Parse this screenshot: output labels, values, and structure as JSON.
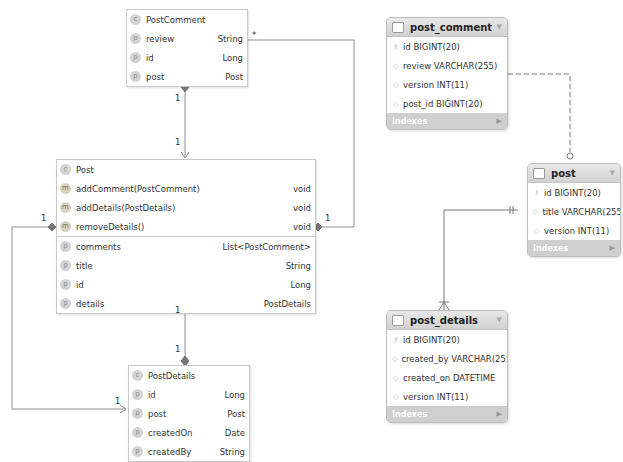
{
  "uml": {
    "post_comment": {
      "name": "PostComment",
      "class_icon": "c",
      "rows": [
        {
          "icon": "p",
          "name": "review",
          "type": "String"
        },
        {
          "icon": "p",
          "name": "id",
          "type": "Long"
        },
        {
          "icon": "p",
          "name": "post",
          "type": "Post"
        }
      ]
    },
    "post": {
      "name": "Post",
      "class_icon": "c",
      "methods": [
        {
          "icon": "m",
          "name": "addComment(PostComment)",
          "type": "void"
        },
        {
          "icon": "m",
          "name": "addDetails(PostDetails)",
          "type": "void"
        },
        {
          "icon": "m",
          "name": "removeDetails()",
          "type": "void"
        }
      ],
      "fields": [
        {
          "icon": "p",
          "name": "comments",
          "type": "List<PostComment>"
        },
        {
          "icon": "p",
          "name": "title",
          "type": "String"
        },
        {
          "icon": "p",
          "name": "id",
          "type": "Long"
        },
        {
          "icon": "p",
          "name": "details",
          "type": "PostDetails"
        }
      ]
    },
    "post_details": {
      "name": "PostDetails",
      "class_icon": "c",
      "rows": [
        {
          "icon": "p",
          "name": "id",
          "type": "Long"
        },
        {
          "icon": "p",
          "name": "post",
          "type": "Post"
        },
        {
          "icon": "p",
          "name": "createdOn",
          "type": "Date"
        },
        {
          "icon": "p",
          "name": "createdBy",
          "type": "String"
        }
      ]
    },
    "multiplicities": {
      "comment_many": "*",
      "comment_post_top": "1",
      "comment_post_bottom": "1",
      "post_comments_right": "1",
      "details_left_top": "1",
      "details_left_bottom": "1",
      "post_details_top": "1",
      "post_details_bottom": "1"
    }
  },
  "er": {
    "indexes_label": "Indexes",
    "post_comment": {
      "name": "post_comment",
      "columns": [
        "id BIGINT(20)",
        "review VARCHAR(255)",
        "version INT(11)",
        "post_id BIGINT(20)"
      ]
    },
    "post": {
      "name": "post",
      "columns": [
        "id BIGINT(20)",
        "title VARCHAR(255)",
        "version INT(11)"
      ]
    },
    "post_details": {
      "name": "post_details",
      "columns": [
        "id BIGINT(20)",
        "created_by VARCHAR(255)",
        "created_on DATETIME",
        "version INT(11)"
      ]
    }
  }
}
